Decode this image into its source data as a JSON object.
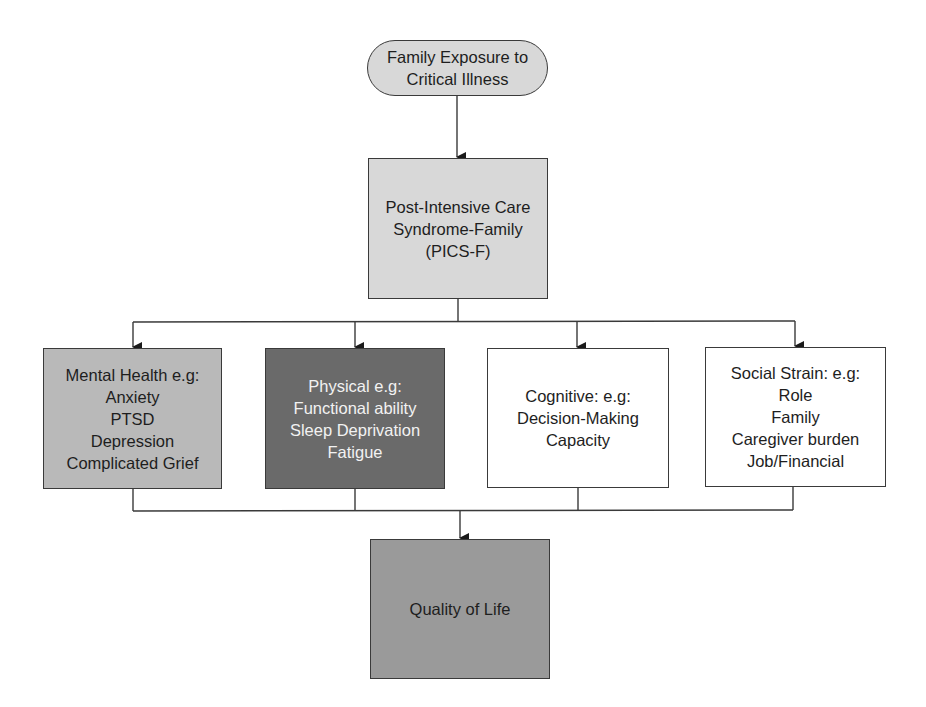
{
  "diagram": {
    "colors": {
      "light_gray": "#d6d6d6",
      "medium_gray": "#b8b8b8",
      "dark_gray": "#6b6b6b",
      "qol_gray": "#999999",
      "white": "#ffffff",
      "line": "#3a3a3a"
    },
    "start": {
      "lines": [
        "Family Exposure to",
        "Critical Illness"
      ]
    },
    "syndrome": {
      "lines": [
        "Post-Intensive Care",
        "Syndrome-Family",
        "(PICS-F)"
      ]
    },
    "domains": [
      {
        "id": "mental",
        "lines": [
          "Mental Health e.g:",
          "Anxiety",
          "PTSD",
          "Depression",
          "Complicated Grief"
        ]
      },
      {
        "id": "physical",
        "lines": [
          "Physical e.g:",
          "Functional ability",
          "Sleep Deprivation",
          "Fatigue"
        ]
      },
      {
        "id": "cognitive",
        "lines": [
          "Cognitive: e.g:",
          "Decision-Making",
          "Capacity"
        ]
      },
      {
        "id": "social",
        "lines": [
          "Social Strain: e.g:",
          "Role",
          "Family",
          "Caregiver burden",
          "Job/Financial"
        ]
      }
    ],
    "outcome": {
      "lines": [
        "Quality of Life"
      ]
    }
  }
}
